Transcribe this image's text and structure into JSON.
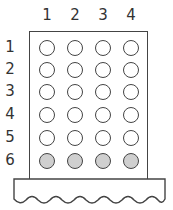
{
  "columns": [
    "1",
    "2",
    "3",
    "4"
  ],
  "rows": [
    "1",
    "2",
    "3",
    "4",
    "5",
    "6"
  ],
  "grid": {
    "filled_rows": [
      6
    ],
    "filled_color": "#cfcfcf",
    "empty_color": "#ffffff"
  }
}
